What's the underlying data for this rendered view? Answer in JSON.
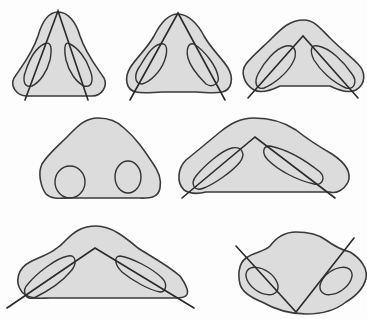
{
  "figure": {
    "fill_color": "#dcdcdc",
    "stroke_color": "#333333",
    "panels": [
      {
        "id": "panel-1",
        "name": "narrow-base-vertical-nostrils",
        "row": 1,
        "col": 1,
        "nostril_shape": "oval",
        "axis_angle": "steep"
      },
      {
        "id": "panel-2",
        "name": "medium-base-oblique-nostrils",
        "row": 1,
        "col": 2,
        "nostril_shape": "oval",
        "axis_angle": "moderate"
      },
      {
        "id": "panel-3",
        "name": "wide-base-inclined-nostrils",
        "row": 1,
        "col": 3,
        "nostril_shape": "oval",
        "axis_angle": "oblique"
      },
      {
        "id": "panel-4",
        "name": "round-nostrils",
        "row": 2,
        "col": 1,
        "nostril_shape": "circle",
        "axis_angle": "none"
      },
      {
        "id": "panel-5",
        "name": "flat-base-elongated-nostrils",
        "row": 2,
        "col": 2,
        "nostril_shape": "elongated",
        "axis_angle": "shallow"
      },
      {
        "id": "panel-6",
        "name": "very-flat-base-horizontal-nostrils",
        "row": 3,
        "col": 1,
        "nostril_shape": "elongated",
        "axis_angle": "very-shallow"
      },
      {
        "id": "panel-7",
        "name": "inverted-axis-nostrils",
        "row": 3,
        "col": 2,
        "nostril_shape": "oval",
        "axis_angle": "inverted"
      }
    ]
  }
}
